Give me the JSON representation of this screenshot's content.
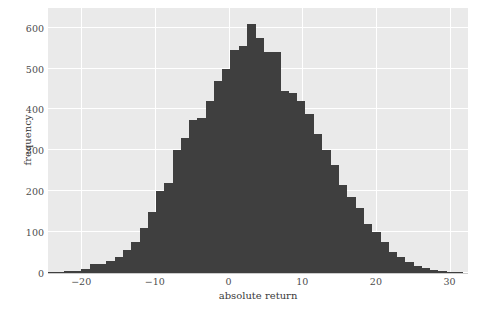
{
  "chart_data": {
    "type": "bar",
    "subtype": "histogram",
    "title": "",
    "xlabel": "absolute return",
    "ylabel": "frequency",
    "xlim": [
      -24.5,
      32.5
    ],
    "ylim": [
      0,
      648
    ],
    "xticks": [
      -20,
      -10,
      0,
      10,
      20,
      30
    ],
    "yticks": [
      0,
      100,
      200,
      300,
      400,
      500,
      600
    ],
    "grid": true,
    "legend": null,
    "bar_color": "#3f3f3f",
    "plot_background": "#eaeaea",
    "gridline_color": "#ffffff",
    "figure_background": "#ffffff",
    "bin_width": 1.125,
    "x": [
      -23.9,
      -22.8,
      -21.7,
      -20.5,
      -19.4,
      -18.3,
      -17.2,
      -16.0,
      -14.9,
      -13.8,
      -12.7,
      -11.5,
      -10.4,
      -9.3,
      -8.2,
      -7.0,
      -5.9,
      -4.8,
      -3.7,
      -2.5,
      -1.4,
      -0.3,
      0.8,
      2.0,
      3.1,
      4.2,
      5.3,
      6.5,
      7.6,
      8.7,
      9.8,
      11.0,
      12.1,
      13.2,
      14.3,
      15.5,
      16.6,
      17.7,
      18.8,
      20.0,
      21.1,
      22.2,
      23.3,
      24.5,
      25.6,
      26.7,
      27.8,
      29.0,
      30.1,
      31.2
    ],
    "values": [
      2,
      3,
      4,
      6,
      10,
      21,
      22,
      29,
      40,
      56,
      75,
      110,
      150,
      200,
      220,
      300,
      330,
      375,
      380,
      420,
      470,
      500,
      545,
      555,
      610,
      575,
      540,
      540,
      445,
      440,
      420,
      390,
      340,
      300,
      265,
      215,
      185,
      160,
      120,
      100,
      75,
      52,
      38,
      26,
      18,
      12,
      7,
      5,
      3,
      2
    ],
    "categories": null
  }
}
